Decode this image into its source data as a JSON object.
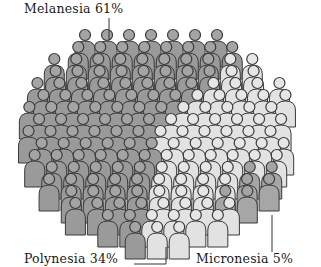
{
  "chart_data": {
    "type": "pie",
    "style": "pictogram-crowd",
    "title": "",
    "categories": [
      "Melanesia",
      "Polynesia",
      "Micronesia"
    ],
    "values": [
      61,
      34,
      5
    ],
    "unit": "%",
    "labels": [
      {
        "name": "Melanesia",
        "value": 61,
        "text": "Melanesia 61%",
        "position": "top-left"
      },
      {
        "name": "Polynesia",
        "value": 34,
        "text": "Polynesia 34%",
        "position": "bottom-left"
      },
      {
        "name": "Micronesia",
        "value": 5,
        "text": "Micronesia 5%",
        "position": "bottom-right"
      }
    ],
    "colors": {
      "Melanesia": "#9a9a9a",
      "Polynesia": "#e2e2e2",
      "Micronesia": "#a6a6a6"
    },
    "legend": "none",
    "grid": false
  },
  "labels": {
    "melanesia": "Melanesia 61%",
    "polynesia": "Polynesia 34%",
    "micronesia": "Micronesia 5%"
  },
  "style": {
    "outline": "#3a3a3a",
    "background": "#ffffff"
  }
}
